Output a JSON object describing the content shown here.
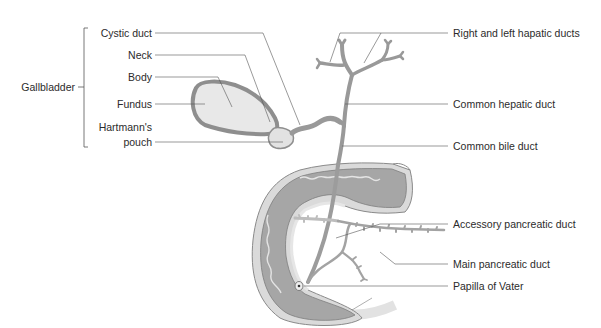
{
  "diagram": {
    "type": "anatomical-labeled-illustration",
    "colors": {
      "background": "#ffffff",
      "duct_gray": "#9a9a9a",
      "wall_dark": "#8c8c8c",
      "lumen_fill": "#a8a8a8",
      "gallbladder_fill": "#e6e6e6",
      "mucosa_light": "#d8d8d8",
      "leader_line": "#555555",
      "text": "#2b2b2b"
    },
    "group_label": {
      "text": "Gallbladder"
    },
    "left_labels": [
      {
        "id": "cystic-duct",
        "text": "Cystic duct"
      },
      {
        "id": "neck",
        "text": "Neck"
      },
      {
        "id": "body",
        "text": "Body"
      },
      {
        "id": "fundus",
        "text": "Fundus"
      },
      {
        "id": "hartmanns-pouch-line1",
        "text": "Hartmann's"
      },
      {
        "id": "hartmanns-pouch-line2",
        "text": "pouch"
      }
    ],
    "right_labels": [
      {
        "id": "right-left-hepatic-ducts",
        "text": "Right and left hapatic ducts"
      },
      {
        "id": "common-hepatic-duct",
        "text": "Common hepatic duct"
      },
      {
        "id": "common-bile-duct",
        "text": "Common bile duct"
      },
      {
        "id": "accessory-pancreatic-duct",
        "text": "Accessory pancreatic duct"
      },
      {
        "id": "main-pancreatic-duct",
        "text": "Main pancreatic duct"
      },
      {
        "id": "papilla-of-vater",
        "text": "Papilla of Vater"
      }
    ]
  }
}
